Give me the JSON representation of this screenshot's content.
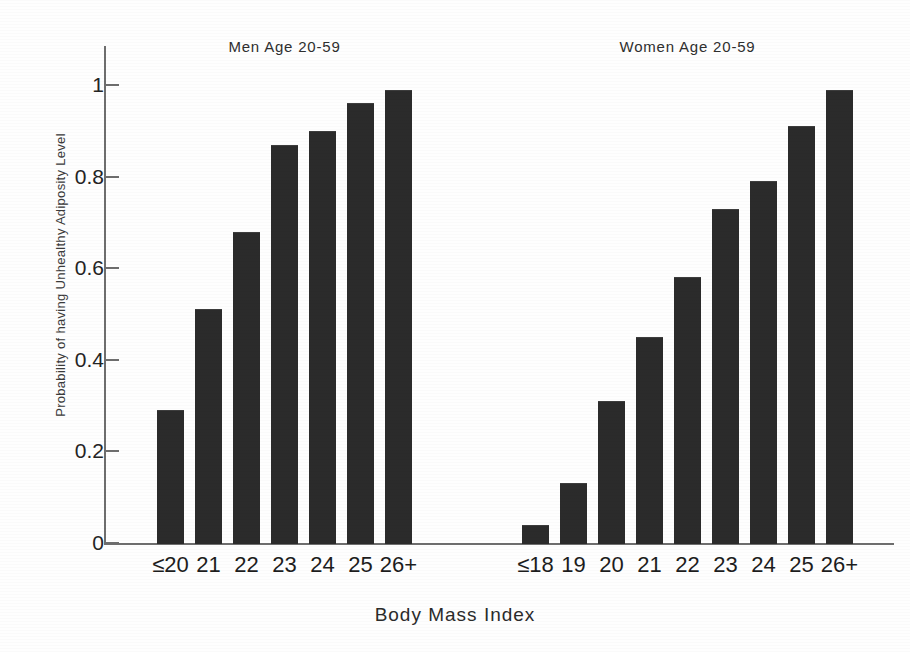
{
  "chart_data": {
    "type": "bar",
    "title": "",
    "xlabel": "Body Mass Index",
    "ylabel": "Probability of having Unhealthy Adiposity Level",
    "ylim": [
      0,
      1.05
    ],
    "yticks": [
      "0",
      "0.2",
      "0.4",
      "0.6",
      "0.8",
      "1"
    ],
    "ytick_values": [
      0,
      0.2,
      0.4,
      0.6,
      0.8,
      1
    ],
    "grid": false,
    "legend": "none",
    "groups": [
      {
        "name": "men",
        "title": "Men Age 20-59",
        "categories": [
          "≤20",
          "21",
          "22",
          "23",
          "24",
          "25",
          "26+"
        ],
        "values": [
          0.29,
          0.51,
          0.68,
          0.87,
          0.9,
          0.96,
          0.99
        ]
      },
      {
        "name": "women",
        "title": "Women Age 20-59",
        "categories": [
          "≤18",
          "19",
          "20",
          "21",
          "22",
          "23",
          "24",
          "25",
          "26+"
        ],
        "values": [
          0.04,
          0.13,
          0.31,
          0.45,
          0.58,
          0.73,
          0.79,
          0.91,
          0.99
        ]
      }
    ],
    "bar_color": "#2b2b2b",
    "axis_color": "#6e6e6e",
    "background_color": "#fefefe"
  }
}
